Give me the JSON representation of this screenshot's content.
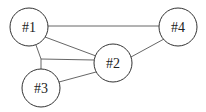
{
  "diagram": {
    "type": "network-graph",
    "nodes": [
      {
        "id": "n1",
        "label": "#1",
        "cx": 29,
        "cy": 27,
        "r": 19
      },
      {
        "id": "n2",
        "label": "#2",
        "cx": 113,
        "cy": 63,
        "r": 19
      },
      {
        "id": "n3",
        "label": "#3",
        "cx": 41,
        "cy": 88,
        "r": 19
      },
      {
        "id": "n4",
        "label": "#4",
        "cx": 178,
        "cy": 27,
        "r": 19
      }
    ],
    "junctions": [
      {
        "id": "j1",
        "x": 41,
        "y": 59
      }
    ],
    "edges": [
      {
        "from": "n1",
        "to": "n4",
        "points": [
          [
            48,
            26
          ],
          [
            159,
            26
          ]
        ]
      },
      {
        "from": "n1",
        "to": "n2",
        "points": [
          [
            45,
            37
          ],
          [
            96,
            56
          ]
        ]
      },
      {
        "from": "n1",
        "to": "j1",
        "points": [
          [
            36,
            45
          ],
          [
            41,
            59
          ]
        ]
      },
      {
        "from": "j1",
        "to": "n3",
        "points": [
          [
            41,
            59
          ],
          [
            41,
            69
          ]
        ]
      },
      {
        "from": "j1",
        "to": "n2",
        "points": [
          [
            41,
            59
          ],
          [
            94,
            60
          ]
        ]
      },
      {
        "from": "n3",
        "to": "n2",
        "points": [
          [
            59,
            82
          ],
          [
            96,
            72
          ]
        ]
      },
      {
        "from": "n4",
        "to": "n2",
        "points": [
          [
            164,
            39
          ],
          [
            131,
            57
          ]
        ]
      }
    ],
    "colors": {
      "stroke": "#333333",
      "edge": "#555555",
      "fill": "#ffffff",
      "text": "#222222"
    }
  }
}
